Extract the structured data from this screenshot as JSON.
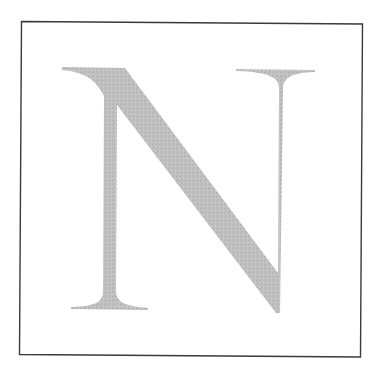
{
  "figure": {
    "letter": "N",
    "letter_color": "#bdbdbd",
    "letter_texture_color": "#a9a9a9",
    "border_color": "#3a3a3a",
    "background_color": "#ffffff"
  }
}
